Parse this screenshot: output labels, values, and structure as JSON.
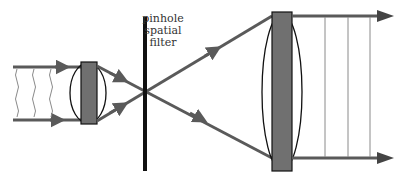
{
  "diagram": {
    "labels": {
      "filter_line1": "pinhole",
      "filter_line2": "spatial",
      "filter_line3": "filter"
    },
    "components": [
      {
        "id": "input-beam",
        "type": "collimated beam",
        "wavefronts": "wavy (aberrated)"
      },
      {
        "id": "lens-1",
        "type": "converging lens (small)"
      },
      {
        "id": "pinhole",
        "type": "pinhole spatial filter"
      },
      {
        "id": "lens-2",
        "type": "converging lens (large)"
      },
      {
        "id": "output-beam",
        "type": "expanded collimated beam",
        "wavefronts": "straight (clean)"
      }
    ],
    "colors": {
      "beam": "#5a5a5a",
      "lens_body": "#707070",
      "outline": "#111111",
      "wavefront": "#8a8a8a"
    }
  }
}
